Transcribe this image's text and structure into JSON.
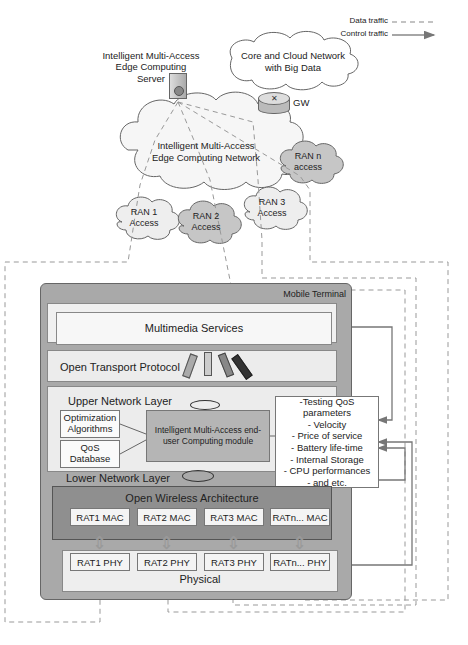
{
  "legend": {
    "data_traffic": "Data traffic",
    "control_traffic": "Control traffic"
  },
  "network": {
    "server_label": "Intelligent Multi-Access Edge Computing Server",
    "server_label_lines": [
      "Intelligent Multi-Access",
      "Edge Computing",
      "Server"
    ],
    "core_cloud_lines": [
      "Core and Cloud Network",
      "with Big Data"
    ],
    "gateway_label": "GW",
    "mec_network_lines": [
      "Intelligent Multi-Access",
      "Edge Computing Network"
    ],
    "ran": [
      {
        "lines": [
          "RAN 1",
          "Access"
        ]
      },
      {
        "lines": [
          "RAN 2",
          "Access"
        ]
      },
      {
        "lines": [
          "RAN 3",
          "Access"
        ]
      },
      {
        "lines": [
          "RAN n",
          "access"
        ]
      }
    ]
  },
  "terminal": {
    "title": "Mobile Terminal",
    "layers": {
      "multimedia": "Multimedia Services",
      "transport": "Open Transport Protocol",
      "upper": "Upper Network Layer",
      "lower": "Lower Network Layer",
      "owa": "Open Wireless Architecture",
      "physical": "Physical"
    },
    "opt_lines": [
      "Optimization",
      "Algorithms"
    ],
    "qos_lines": [
      "QoS",
      "Database"
    ],
    "module_lines": [
      "Intelligent Multi-Access end-",
      "user Computing module"
    ],
    "qos_params": [
      "-Testing QoS parameters",
      "- Velocity",
      "- Price of service",
      "- Battery life-time",
      "- Internal Storage",
      "- CPU performances",
      "- and etc."
    ],
    "mac": [
      "RAT1 MAC",
      "RAT2 MAC",
      "RAT3 MAC",
      "RATn... MAC"
    ],
    "phy": [
      "RAT1 PHY",
      "RAT2 PHY",
      "RAT3 PHY",
      "RATn... PHY"
    ]
  },
  "colors": {
    "terminal_bg": "#a9a9a9",
    "owa_bg": "#8f8f8f",
    "module_bg": "#b5b5b5",
    "cloud_fill": "#f4f4f4",
    "ran_dark": "#c8c8c8",
    "line": "#777777"
  }
}
